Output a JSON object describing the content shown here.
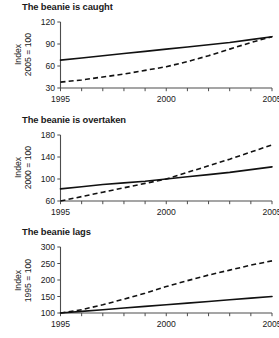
{
  "figure": {
    "background_color": "#ffffff",
    "line_color": "#111111",
    "axis_color": "#4d4d4d"
  },
  "panels": [
    {
      "title": "The beanie is caught",
      "ylabel_line1": "Index",
      "ylabel_line2": "2005 = 100",
      "yticks": [
        "30",
        "60",
        "90",
        "120"
      ],
      "xticks": [
        "1995",
        "2000",
        "2005"
      ]
    },
    {
      "title": "The beanie is overtaken",
      "ylabel_line1": "Index",
      "ylabel_line2": "2000 = 100",
      "yticks": [
        "60",
        "100",
        "140",
        "180"
      ],
      "xticks": [
        "1995",
        "2000",
        "2005"
      ]
    },
    {
      "title": "The beanie lags",
      "ylabel_line1": "Index",
      "ylabel_line2": "1995 = 100",
      "yticks": [
        "100",
        "150",
        "200",
        "250",
        "300"
      ],
      "xticks": [
        "1995",
        "2000",
        "2005"
      ]
    }
  ],
  "chart_data": [
    {
      "type": "line",
      "title": "The beanie is caught",
      "xlabel": "",
      "ylabel": "Index 2005 = 100",
      "xlim": [
        1995,
        2005
      ],
      "ylim": [
        30,
        120
      ],
      "grid": false,
      "legend": "none",
      "xticks": [
        1995,
        1996,
        1997,
        1998,
        1999,
        2000,
        2001,
        2002,
        2003,
        2004,
        2005
      ],
      "xticklabels": [
        "1995",
        "",
        "",
        "",
        "",
        "2000",
        "",
        "",
        "",
        "",
        "2005"
      ],
      "yticks": [
        30,
        60,
        90,
        120
      ],
      "x": [
        1995,
        1996,
        1997,
        1998,
        1999,
        2000,
        2001,
        2002,
        2003,
        2004,
        2005
      ],
      "series": [
        {
          "name": "solid-line",
          "style": "solid",
          "values": [
            68,
            71,
            74,
            77,
            80,
            83,
            86,
            89,
            92,
            96,
            100
          ]
        },
        {
          "name": "dashed-line",
          "style": "dashed",
          "values": [
            38,
            41,
            45,
            49,
            54,
            59,
            66,
            74,
            83,
            92,
            100
          ]
        }
      ]
    },
    {
      "type": "line",
      "title": "The beanie is overtaken",
      "xlabel": "",
      "ylabel": "Index 2000 = 100",
      "xlim": [
        1995,
        2005
      ],
      "ylim": [
        60,
        180
      ],
      "grid": false,
      "legend": "none",
      "xticks": [
        1995,
        1996,
        1997,
        1998,
        1999,
        2000,
        2001,
        2002,
        2003,
        2004,
        2005
      ],
      "xticklabels": [
        "1995",
        "",
        "",
        "",
        "",
        "2000",
        "",
        "",
        "",
        "",
        "2005"
      ],
      "yticks": [
        60,
        100,
        140,
        180
      ],
      "x": [
        1995,
        1996,
        1997,
        1998,
        1999,
        2000,
        2001,
        2002,
        2003,
        2004,
        2005
      ],
      "series": [
        {
          "name": "solid-line",
          "style": "solid",
          "values": [
            82,
            86,
            90,
            93,
            96,
            100,
            104,
            108,
            112,
            117,
            122
          ]
        },
        {
          "name": "dashed-line",
          "style": "dashed",
          "values": [
            60,
            68,
            76,
            84,
            92,
            100,
            112,
            124,
            136,
            149,
            162
          ]
        }
      ]
    },
    {
      "type": "line",
      "title": "The beanie lags",
      "xlabel": "",
      "ylabel": "Index 1995 = 100",
      "xlim": [
        1995,
        2005
      ],
      "ylim": [
        100,
        300
      ],
      "grid": false,
      "legend": "none",
      "xticks": [
        1995,
        1996,
        1997,
        1998,
        1999,
        2000,
        2001,
        2002,
        2003,
        2004,
        2005
      ],
      "xticklabels": [
        "1995",
        "",
        "",
        "",
        "",
        "2000",
        "",
        "",
        "",
        "",
        "2005"
      ],
      "yticks": [
        100,
        150,
        200,
        250,
        300
      ],
      "x": [
        1995,
        1996,
        1997,
        1998,
        1999,
        2000,
        2001,
        2002,
        2003,
        2004,
        2005
      ],
      "series": [
        {
          "name": "solid-line",
          "style": "solid",
          "values": [
            100,
            105,
            110,
            115,
            120,
            125,
            130,
            135,
            140,
            145,
            150
          ]
        },
        {
          "name": "dashed-line",
          "style": "dashed",
          "values": [
            100,
            110,
            125,
            142,
            160,
            180,
            198,
            215,
            230,
            245,
            258
          ]
        }
      ]
    }
  ]
}
